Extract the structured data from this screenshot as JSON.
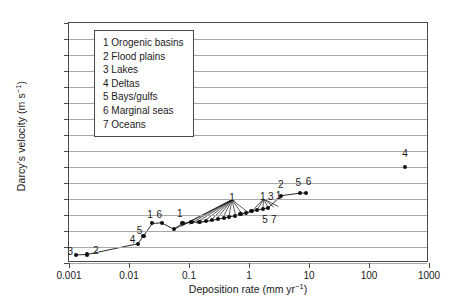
{
  "chart_data": {
    "type": "scatter",
    "title": "",
    "xlabel": "Deposition rate (mm yr−1)",
    "ylabel": "Darcy's velocity (m s−1)",
    "xscale": "log",
    "yscale": "log",
    "xlim": [
      0.001,
      1000
    ],
    "ylim": [
      1e-14,
      10
    ],
    "grid": "horizontal",
    "legend_position": "upper-left-inside",
    "xticklabels": [
      "0.001",
      "0.01",
      "0.1",
      "1",
      "10",
      "100",
      "1000"
    ],
    "yticklabels": [
      "10",
      "1",
      "0.1",
      "0.01",
      "0.001",
      "1E−4",
      "1E−5",
      "1E−6",
      "1E−7",
      "1E−8",
      "1E−9",
      "1E−10",
      "1E−11",
      "1E−12",
      "1E−13",
      "1E−14"
    ],
    "legend": [
      {
        "key": "1",
        "label": "1 Orogenic basins"
      },
      {
        "key": "2",
        "label": "2 Flood plains"
      },
      {
        "key": "3",
        "label": "3 Lakes"
      },
      {
        "key": "4",
        "label": "4 Deltas"
      },
      {
        "key": "5",
        "label": "5 Bays/gulfs"
      },
      {
        "key": "6",
        "label": "6 Marginal seas"
      },
      {
        "key": "7",
        "label": "7 Oceans"
      }
    ],
    "points": [
      {
        "x": 0.0013,
        "y": 3.2e-14
      },
      {
        "x": 0.002,
        "y": 3.4e-14
      },
      {
        "x": 0.014,
        "y": 1.6e-13
      },
      {
        "x": 0.0175,
        "y": 5e-13
      },
      {
        "x": 0.0245,
        "y": 3e-12
      },
      {
        "x": 0.035,
        "y": 3.2e-12
      },
      {
        "x": 0.056,
        "y": 1.3e-12
      },
      {
        "x": 0.078,
        "y": 3e-12
      },
      {
        "x": 0.11,
        "y": 3.5e-12
      },
      {
        "x": 0.15,
        "y": 3.7e-12
      },
      {
        "x": 0.19,
        "y": 4e-12
      },
      {
        "x": 0.24,
        "y": 4.6e-12
      },
      {
        "x": 0.3,
        "y": 5.4e-12
      },
      {
        "x": 0.38,
        "y": 6.4e-12
      },
      {
        "x": 0.47,
        "y": 7.6e-12
      },
      {
        "x": 0.58,
        "y": 9e-12
      },
      {
        "x": 0.72,
        "y": 1.1e-11
      },
      {
        "x": 0.9,
        "y": 1.4e-11
      },
      {
        "x": 1.1,
        "y": 1.7e-11
      },
      {
        "x": 1.35,
        "y": 2e-11
      },
      {
        "x": 1.7,
        "y": 2.4e-11
      },
      {
        "x": 2.1,
        "y": 2.8e-11
      },
      {
        "x": 3.4,
        "y": 1.6e-10
      },
      {
        "x": 7.0,
        "y": 2.3e-10
      },
      {
        "x": 9.0,
        "y": 2.4e-10
      },
      {
        "x": 400.0,
        "y": 1e-08
      }
    ],
    "point_labels": [
      {
        "text": "3",
        "x": 0.00105,
        "y": 6e-14
      },
      {
        "text": "2",
        "x": 0.0028,
        "y": 6.5e-14
      },
      {
        "text": "4",
        "x": 0.0115,
        "y": 3e-13
      },
      {
        "text": "5",
        "x": 0.015,
        "y": 1.1e-12
      },
      {
        "text": "1",
        "x": 0.0225,
        "y": 1.1e-11
      },
      {
        "text": "6",
        "x": 0.032,
        "y": 1.1e-11
      },
      {
        "text": "1",
        "x": 0.07,
        "y": 1.4e-11
      },
      {
        "text": "1",
        "x": 0.52,
        "y": 1.4e-10
      },
      {
        "text": "1",
        "x": 1.7,
        "y": 1.5e-10
      },
      {
        "text": "3",
        "x": 2.3,
        "y": 1.6e-10
      },
      {
        "text": "1",
        "x": 3.1,
        "y": 1.7e-10
      },
      {
        "text": "5",
        "x": 1.85,
        "y": 6e-12
      },
      {
        "text": "7",
        "x": 2.6,
        "y": 5.5e-12
      },
      {
        "text": "2",
        "x": 3.4,
        "y": 9e-10
      },
      {
        "text": "5",
        "x": 6.6,
        "y": 1.1e-09
      },
      {
        "text": "6",
        "x": 9.8,
        "y": 1.3e-09
      },
      {
        "text": "4",
        "x": 400.0,
        "y": 7e-08
      }
    ],
    "fans": [
      {
        "apex_x": 0.52,
        "apex_y": 9e-11,
        "base": [
          [
            0.055,
            1.2e-12
          ],
          [
            0.075,
            2e-12
          ],
          [
            0.1,
            2.6e-12
          ],
          [
            0.13,
            3.1e-12
          ],
          [
            0.17,
            3.5e-12
          ],
          [
            0.22,
            4e-12
          ],
          [
            0.28,
            4.8e-12
          ],
          [
            0.36,
            5.8e-12
          ],
          [
            0.46,
            7e-12
          ],
          [
            0.6,
            8.6e-12
          ],
          [
            0.78,
            1.05e-11
          ],
          [
            1.0,
            1.3e-11
          ]
        ]
      },
      {
        "apex_x": 1.75,
        "apex_y": 1e-10,
        "base": [
          [
            1.1,
            1.6e-11
          ],
          [
            1.35,
            1.9e-11
          ],
          [
            1.7,
            2.3e-11
          ],
          [
            2.1,
            2.7e-11
          ],
          [
            2.6,
            3.1e-11
          ],
          [
            3.1,
            3.4e-11
          ]
        ]
      }
    ]
  }
}
